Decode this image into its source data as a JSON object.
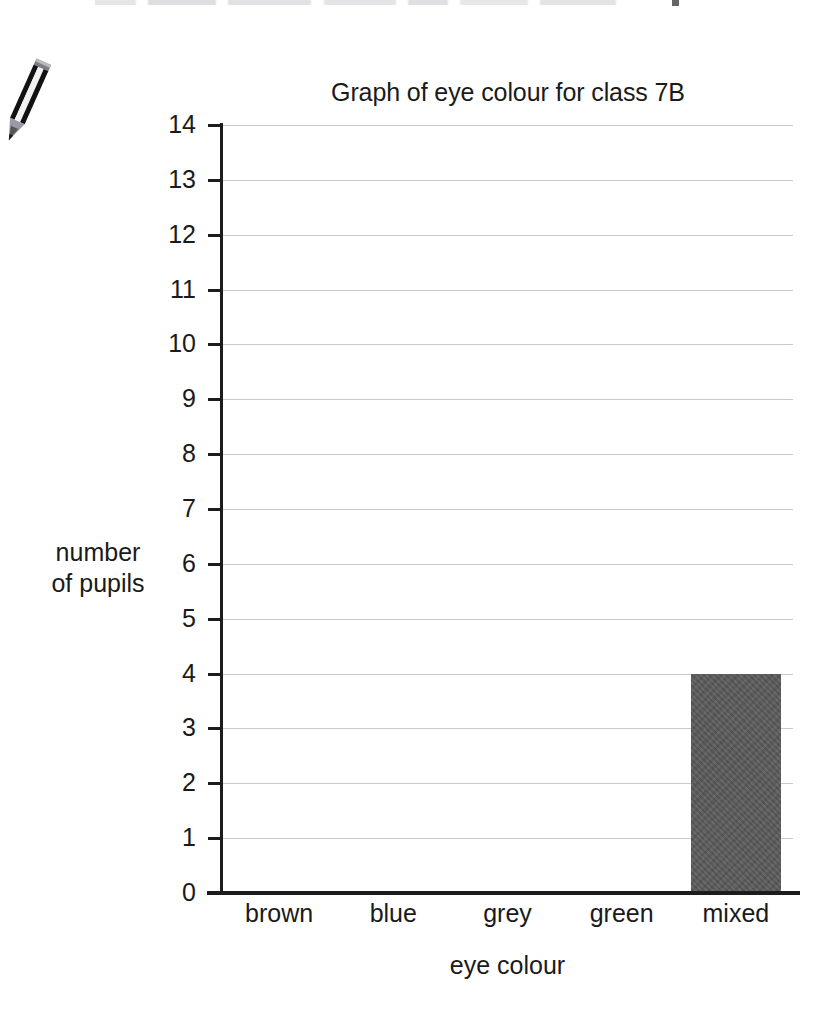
{
  "page": {
    "background_color": "#ffffff",
    "scan_artifact_top": "partially cropped line of text"
  },
  "icons": {
    "pencil": "pencil-icon"
  },
  "chart_data": {
    "type": "bar",
    "title": "Graph of eye colour for class 7B",
    "xlabel": "eye colour",
    "ylabel": "number of pupils",
    "ylabel_lines": [
      "number",
      "of pupils"
    ],
    "categories": [
      "brown",
      "blue",
      "grey",
      "green",
      "mixed"
    ],
    "values": [
      0,
      0,
      0,
      0,
      4
    ],
    "ylim": [
      0,
      14
    ],
    "yticks": [
      14,
      13,
      12,
      11,
      10,
      9,
      8,
      7,
      6,
      5,
      4,
      3,
      2,
      1,
      0
    ],
    "ytick_labels": [
      "14",
      "13",
      "12",
      "11",
      "10",
      "9",
      "8",
      "7",
      "6",
      "5",
      "4",
      "3",
      "2",
      "1",
      "0"
    ],
    "grid": true,
    "legend": null,
    "bar_color": "#595959",
    "grid_color": "#c9c9cf",
    "axis_color": "#1c1c1c"
  }
}
